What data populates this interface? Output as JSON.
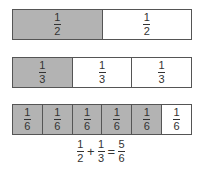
{
  "bars": [
    {
      "cells": [
        {
          "num": "1",
          "den": "2",
          "shaded": true
        },
        {
          "num": "1",
          "den": "2",
          "shaded": false
        }
      ]
    },
    {
      "cells": [
        {
          "num": "1",
          "den": "3",
          "shaded": true
        },
        {
          "num": "1",
          "den": "3",
          "shaded": false
        },
        {
          "num": "1",
          "den": "3",
          "shaded": false
        }
      ]
    },
    {
      "cells": [
        {
          "num": "1",
          "den": "6",
          "shaded": true
        },
        {
          "num": "1",
          "den": "6",
          "shaded": true
        },
        {
          "num": "1",
          "den": "6",
          "shaded": true
        },
        {
          "num": "1",
          "den": "6",
          "shaded": true
        },
        {
          "num": "1",
          "den": "6",
          "shaded": true
        },
        {
          "num": "1",
          "den": "6",
          "shaded": false
        }
      ]
    }
  ],
  "equation": {
    "a": {
      "num": "1",
      "den": "2"
    },
    "plus": "+",
    "b": {
      "num": "1",
      "den": "3"
    },
    "equals": "=",
    "result": {
      "num": "5",
      "den": "6"
    }
  },
  "colors": {
    "shaded": "#b3b3b3",
    "border": "#555555"
  }
}
